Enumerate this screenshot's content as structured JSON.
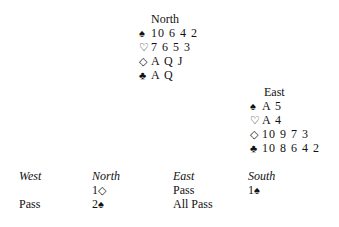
{
  "north": {
    "title": "North",
    "spades": "10 6 4 2",
    "hearts": "7 6 5 3",
    "diamonds": "A Q J",
    "clubs": "A Q"
  },
  "east": {
    "title": "East",
    "spades": "A 5",
    "hearts": "A 4",
    "diamonds": "10 9 7 3",
    "clubs": "10 8 6 4 2"
  },
  "icons": {
    "spade": "♠",
    "heart": "♡",
    "diamond": "◇",
    "club": "♣"
  },
  "auction": {
    "headers": [
      "West",
      "North",
      "East",
      "South"
    ],
    "rows": [
      [
        "",
        "1",
        "Pass",
        "1"
      ],
      [
        "Pass",
        "2",
        "All Pass",
        ""
      ]
    ],
    "row0_north_suit": "◇",
    "row0_south_suit": "♠",
    "row1_north_suit": "♠"
  }
}
